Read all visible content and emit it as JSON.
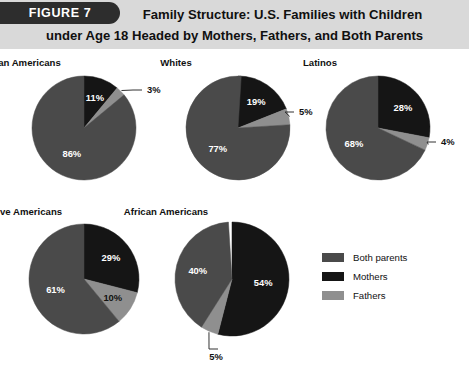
{
  "header": {
    "badge_label": "FIGURE 7",
    "title_line1": "Family Structure: U.S. Families with Children",
    "title_line2": "under Age 18 Headed by Mothers, Fathers, and Both Parents"
  },
  "legend": {
    "items": [
      {
        "label": "Both parents",
        "color": "#4a4a4a"
      },
      {
        "label": "Mothers",
        "color": "#151515"
      },
      {
        "label": "Fathers",
        "color": "#8f8f8f"
      }
    ]
  },
  "colors": {
    "both_parents": "#4a4a4a",
    "mothers": "#151515",
    "fathers": "#8f8f8f",
    "header_band": "#d9d9d9",
    "badge": "#2d2d2d"
  },
  "chart_data": {
    "type": "pie",
    "title": "Family Structure: U.S. Families with Children under Age 18 Headed by Mothers, Fathers, and Both Parents",
    "figure_label": "FIGURE 7",
    "unit": "%",
    "legend": [
      "Both parents",
      "Mothers",
      "Fathers"
    ],
    "legend_position": "right",
    "series_order_clockwise_from_12oclock": [
      "Mothers",
      "Fathers",
      "Both parents"
    ],
    "charts": [
      {
        "name": "Asian Americans",
        "slices": [
          {
            "name": "Mothers",
            "value": 11,
            "label": "11%",
            "label_placement": "inside"
          },
          {
            "name": "Fathers",
            "value": 3,
            "label": "3%",
            "label_placement": "callout"
          },
          {
            "name": "Both parents",
            "value": 86,
            "label": "86%",
            "label_placement": "inside"
          }
        ]
      },
      {
        "name": "Whites",
        "slices": [
          {
            "name": "Mothers",
            "value": 19,
            "label": "19%",
            "label_placement": "inside"
          },
          {
            "name": "Fathers",
            "value": 5,
            "label": "5%",
            "label_placement": "callout"
          },
          {
            "name": "Both parents",
            "value": 77,
            "label": "77%",
            "label_placement": "inside"
          }
        ]
      },
      {
        "name": "Latinos",
        "slices": [
          {
            "name": "Mothers",
            "value": 28,
            "label": "28%",
            "label_placement": "inside"
          },
          {
            "name": "Fathers",
            "value": 4,
            "label": "4%",
            "label_placement": "callout"
          },
          {
            "name": "Both parents",
            "value": 68,
            "label": "68%",
            "label_placement": "inside"
          }
        ]
      },
      {
        "name": "Native Americans",
        "slices": [
          {
            "name": "Mothers",
            "value": 29,
            "label": "29%",
            "label_placement": "inside"
          },
          {
            "name": "Fathers",
            "value": 10,
            "label": "10%",
            "label_placement": "inside"
          },
          {
            "name": "Both parents",
            "value": 61,
            "label": "61%",
            "label_placement": "inside"
          }
        ]
      },
      {
        "name": "African Americans",
        "slices": [
          {
            "name": "Mothers",
            "value": 54,
            "label": "54%",
            "label_placement": "inside"
          },
          {
            "name": "Fathers",
            "value": 5,
            "label": "5%",
            "label_placement": "callout"
          },
          {
            "name": "Both parents",
            "value": 40,
            "label": "40%",
            "label_placement": "inside"
          }
        ]
      }
    ]
  }
}
